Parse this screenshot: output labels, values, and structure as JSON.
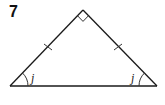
{
  "problem": {
    "number": "7"
  },
  "figure": {
    "type": "right isosceles triangle",
    "stroke_color": "#1a1a1a",
    "vertices": {
      "apex": [
        83,
        10
      ],
      "base_left": [
        10,
        86
      ],
      "base_right": [
        157,
        86
      ]
    },
    "right_angle_marker": "apex",
    "congruent_sides_tick": 1,
    "angles": [
      {
        "vertex": "base_left",
        "label": "j"
      },
      {
        "vertex": "base_right",
        "label": "j"
      }
    ]
  }
}
